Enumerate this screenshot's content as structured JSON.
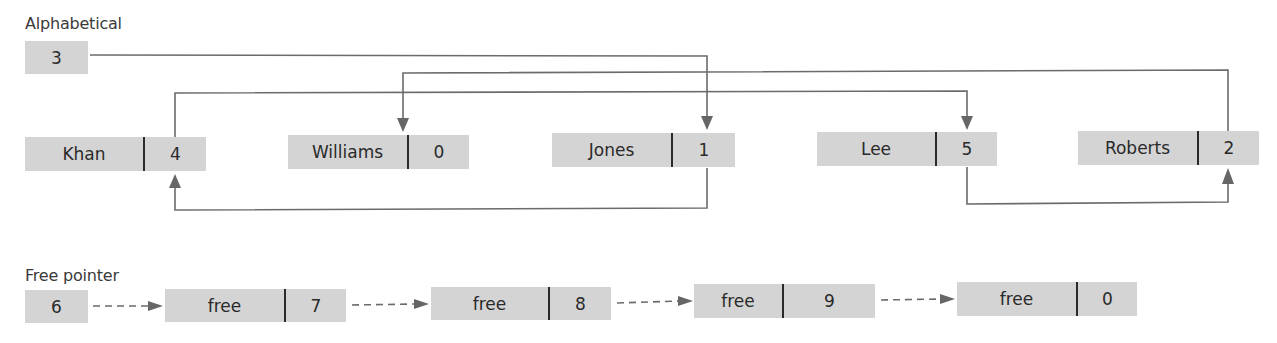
{
  "alphabetical": {
    "label": "Alphabetical",
    "start_pointer": "3"
  },
  "nodes": [
    {
      "index": 0,
      "data": "Khan",
      "next": "4"
    },
    {
      "index": 1,
      "data": "Williams",
      "next": "0"
    },
    {
      "index": 2,
      "data": "Jones",
      "next": "1"
    },
    {
      "index": 3,
      "data": "Lee",
      "next": "5"
    },
    {
      "index": 4,
      "data": "Roberts",
      "next": "2"
    }
  ],
  "free_list": {
    "label": "Free pointer",
    "start_pointer": "6",
    "nodes": [
      {
        "data": "free",
        "next": "7"
      },
      {
        "data": "free",
        "next": "8"
      },
      {
        "data": "free",
        "next": "9"
      },
      {
        "data": "free",
        "next": "0"
      }
    ]
  },
  "colors": {
    "box_fill": "#d4d4d4",
    "line": "#6b6b6b",
    "divider": "#2a2a2a",
    "text": "#2a2a2a"
  }
}
